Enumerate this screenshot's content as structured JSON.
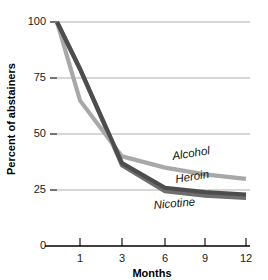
{
  "chart_data": {
    "type": "line",
    "title": "",
    "xlabel": "Months",
    "ylabel": "Percent of abstainers",
    "x": [
      0,
      1,
      3,
      6,
      9,
      12
    ],
    "categories": [
      "0",
      "1",
      "3",
      "6",
      "9",
      "12"
    ],
    "xticks": [
      "1",
      "3",
      "6",
      "9",
      "12"
    ],
    "yticks": [
      "0",
      "25",
      "50",
      "75",
      "100"
    ],
    "ylim": [
      0,
      100
    ],
    "grid": "horizontal",
    "legend_position": "inline-right-of-lines",
    "series": [
      {
        "name": "Alcohol",
        "color": "#a8a8a8",
        "values": [
          100,
          65,
          40,
          35,
          32,
          30
        ]
      },
      {
        "name": "Heroin",
        "color": "#4d4d4d",
        "values": [
          100,
          79,
          37,
          26,
          24,
          23
        ]
      },
      {
        "name": "Nicotine",
        "color": "#6e6e6e",
        "values": [
          100,
          79,
          36,
          24.5,
          22.5,
          21.5
        ]
      }
    ],
    "annotations": [
      {
        "text": "Alcohol",
        "x": 9,
        "y": 40
      },
      {
        "text": "Heroin",
        "x": 9,
        "y": 30
      },
      {
        "text": "Nicotine",
        "x": 7.5,
        "y": 19
      }
    ]
  },
  "axis": {
    "y_title": "Percent of abstainers",
    "x_title": "Months",
    "y_tick_0": "0",
    "y_tick_25": "25",
    "y_tick_50": "50",
    "y_tick_75": "75",
    "y_tick_100": "100",
    "x_tick_1": "1",
    "x_tick_3": "3",
    "x_tick_6": "6",
    "x_tick_9": "9",
    "x_tick_12": "12"
  },
  "labels": {
    "alcohol": "Alcohol",
    "heroin": "Heroin",
    "nicotine": "Nicotine"
  },
  "colors": {
    "alcohol": "#a8a8a8",
    "heroin": "#4d4d4d",
    "nicotine": "#6e6e6e",
    "grid": "#9a9a9a",
    "axis": "#000000",
    "background": "#ffffff"
  }
}
